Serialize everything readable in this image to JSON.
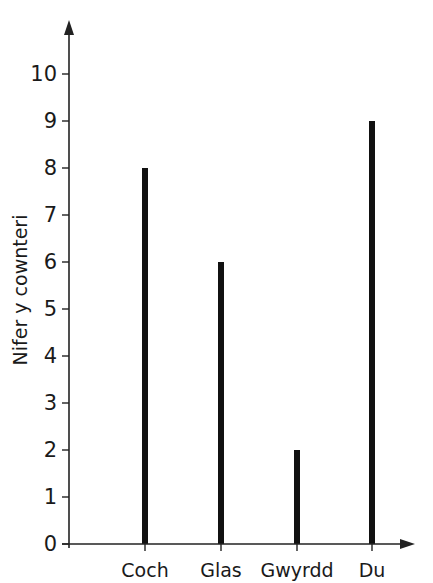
{
  "chart_data": {
    "type": "bar",
    "title": "",
    "xlabel": "",
    "ylabel": "Nifer y cownteri",
    "categories": [
      "Coch",
      "Glas",
      "Gwyrdd",
      "Du"
    ],
    "values": [
      8,
      6,
      2,
      9
    ],
    "ylim": [
      0,
      10
    ],
    "yticks": [
      0,
      1,
      2,
      3,
      4,
      5,
      6,
      7,
      8,
      9,
      10
    ],
    "grid": false,
    "legend": null,
    "bar_style": "thin vertical lines (stick/bar-line chart)",
    "colors": {
      "bar": "#111111",
      "axis": "#222222"
    }
  }
}
